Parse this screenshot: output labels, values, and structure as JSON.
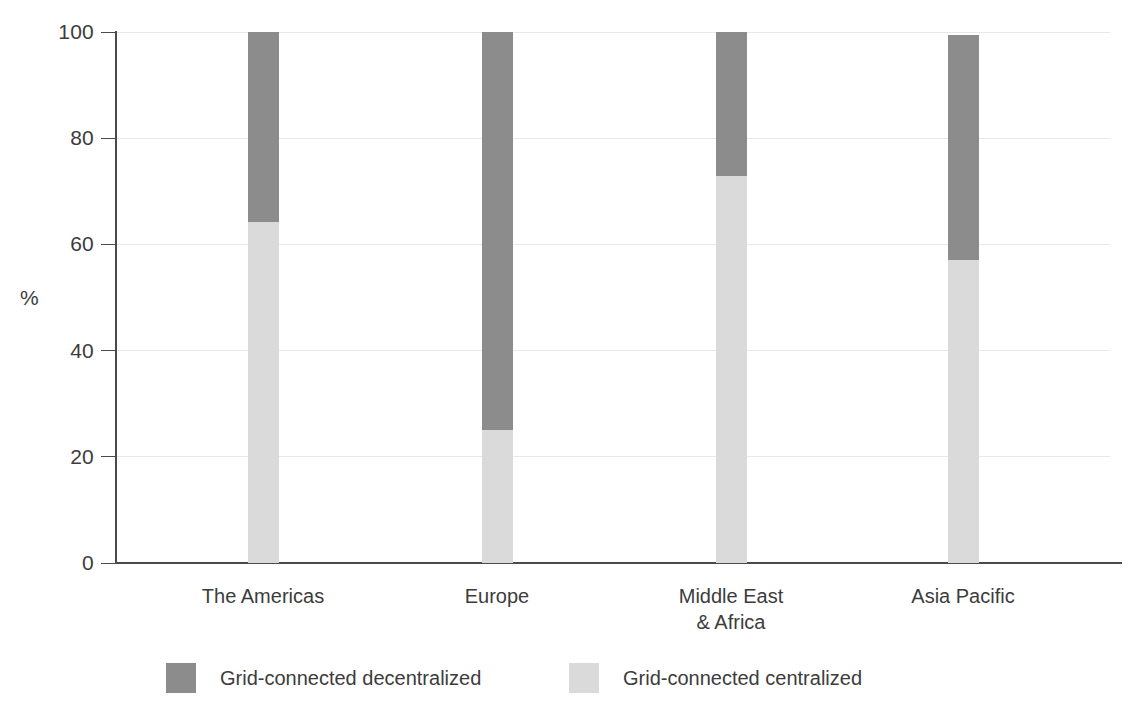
{
  "chart_data": {
    "type": "bar",
    "stacked": true,
    "title": "",
    "subtitle": "",
    "xlabel": "",
    "ylabel": "%",
    "ylim": [
      0,
      100
    ],
    "yticks": [
      0,
      20,
      40,
      60,
      80,
      100
    ],
    "ytick_labels": [
      "0",
      "20",
      "40",
      "60",
      "80",
      "100"
    ],
    "grid": true,
    "grid_axis": "y",
    "legend_position": "bottom",
    "categories": [
      "The Americas",
      "Europe",
      "Middle East\n& Africa",
      "Asia Pacific"
    ],
    "series": [
      {
        "name": "Grid-connected centralized",
        "color": "#dadada",
        "values": [
          64.2,
          25.0,
          72.9,
          57.1
        ]
      },
      {
        "name": "Grid-connected decentralized",
        "color": "#8c8c8c",
        "values": [
          35.8,
          75.0,
          27.1,
          42.4
        ]
      }
    ],
    "totals": [
      100,
      100,
      100,
      99.5
    ]
  },
  "axis": {
    "y_title": "%",
    "ticks": [
      {
        "value": 100,
        "label": "100"
      },
      {
        "value": 80,
        "label": "80"
      },
      {
        "value": 60,
        "label": "60"
      },
      {
        "value": 40,
        "label": "40"
      },
      {
        "value": 20,
        "label": "20"
      },
      {
        "value": 0,
        "label": "0"
      }
    ]
  },
  "categories": [
    {
      "label": "The Americas"
    },
    {
      "label": "Europe"
    },
    {
      "label": "Middle East\n& Africa"
    },
    {
      "label": "Asia Pacific"
    }
  ],
  "legend": {
    "items": [
      {
        "label": "Grid-connected decentralized",
        "color": "#8c8c8c",
        "swatch": "dark"
      },
      {
        "label": "Grid-connected centralized",
        "color": "#dadada",
        "swatch": "light"
      }
    ]
  },
  "colors": {
    "decentralized": "#8c8c8c",
    "centralized": "#dadada",
    "axis": "#4a4a4a",
    "grid": "#e8e8e8",
    "text": "#3c3c3c",
    "background": "#ffffff"
  }
}
